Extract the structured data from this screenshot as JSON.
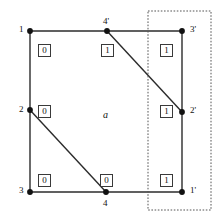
{
  "figure": {
    "colors": {
      "edge": "#2b2b2b",
      "vertex": "#111111",
      "box_border": "#3a3a3a",
      "box_fill": "#ffffff",
      "dotted_rect": "#555555",
      "text": "#111111",
      "background": "#ffffff"
    },
    "vertices": [
      {
        "id": "v1",
        "label": "1",
        "x": 30,
        "y": 31,
        "label_x": 19,
        "label_y": 25
      },
      {
        "id": "v4p",
        "label": "4'",
        "x": 107,
        "y": 31,
        "label_x": 103,
        "label_y": 17
      },
      {
        "id": "v3p",
        "label": "3'",
        "x": 182,
        "y": 31,
        "label_x": 190,
        "label_y": 25
      },
      {
        "id": "v2",
        "label": "2",
        "x": 30,
        "y": 110,
        "label_x": 19,
        "label_y": 105
      },
      {
        "id": "v2p",
        "label": "2'",
        "x": 182,
        "y": 112,
        "label_x": 190,
        "label_y": 106
      },
      {
        "id": "v3",
        "label": "3",
        "x": 30,
        "y": 192,
        "label_x": 19,
        "label_y": 186
      },
      {
        "id": "v4",
        "label": "4",
        "x": 106,
        "y": 192,
        "label_x": 103,
        "label_y": 199
      },
      {
        "id": "v1p",
        "label": "1'",
        "x": 182,
        "y": 192,
        "label_x": 190,
        "label_y": 186
      }
    ],
    "edges": [
      {
        "id": "top-left",
        "x1": 30,
        "y1": 31,
        "x2": 107,
        "y2": 31
      },
      {
        "id": "top-right",
        "x1": 107,
        "y1": 31,
        "x2": 182,
        "y2": 31
      },
      {
        "id": "left-upper",
        "x1": 30,
        "y1": 31,
        "x2": 30,
        "y2": 110
      },
      {
        "id": "left-lower",
        "x1": 30,
        "y1": 110,
        "x2": 30,
        "y2": 192
      },
      {
        "id": "right-upper",
        "x1": 182,
        "y1": 31,
        "x2": 182,
        "y2": 112
      },
      {
        "id": "right-lower",
        "x1": 182,
        "y1": 112,
        "x2": 182,
        "y2": 192
      },
      {
        "id": "bottom-left",
        "x1": 30,
        "y1": 192,
        "x2": 106,
        "y2": 192
      },
      {
        "id": "bottom-right",
        "x1": 106,
        "y1": 192,
        "x2": 182,
        "y2": 192
      },
      {
        "id": "diagonal-4p-2p",
        "x1": 107,
        "y1": 31,
        "x2": 182,
        "y2": 112
      },
      {
        "id": "diagonal-2-4",
        "x1": 30,
        "y1": 110,
        "x2": 106,
        "y2": 192
      }
    ],
    "orientation_boxes": [
      {
        "id": "box-top-left",
        "value": "0",
        "x": 38,
        "y": 44
      },
      {
        "id": "box-top-mid",
        "value": "1",
        "x": 101,
        "y": 44
      },
      {
        "id": "box-top-right",
        "value": "1",
        "x": 160,
        "y": 44
      },
      {
        "id": "box-mid-left",
        "value": "0",
        "x": 38,
        "y": 105
      },
      {
        "id": "box-mid-right",
        "value": "1",
        "x": 160,
        "y": 105
      },
      {
        "id": "box-bottom-left",
        "value": "0",
        "x": 38,
        "y": 174
      },
      {
        "id": "box-bottom-mid",
        "value": "0",
        "x": 100,
        "y": 174
      },
      {
        "id": "box-bottom-right",
        "value": "1",
        "x": 160,
        "y": 174
      }
    ],
    "face_label": {
      "text": "a",
      "x": 103,
      "y": 110
    },
    "dotted_rect": {
      "x": 148,
      "y": 11,
      "width": 63,
      "height": 199
    }
  }
}
